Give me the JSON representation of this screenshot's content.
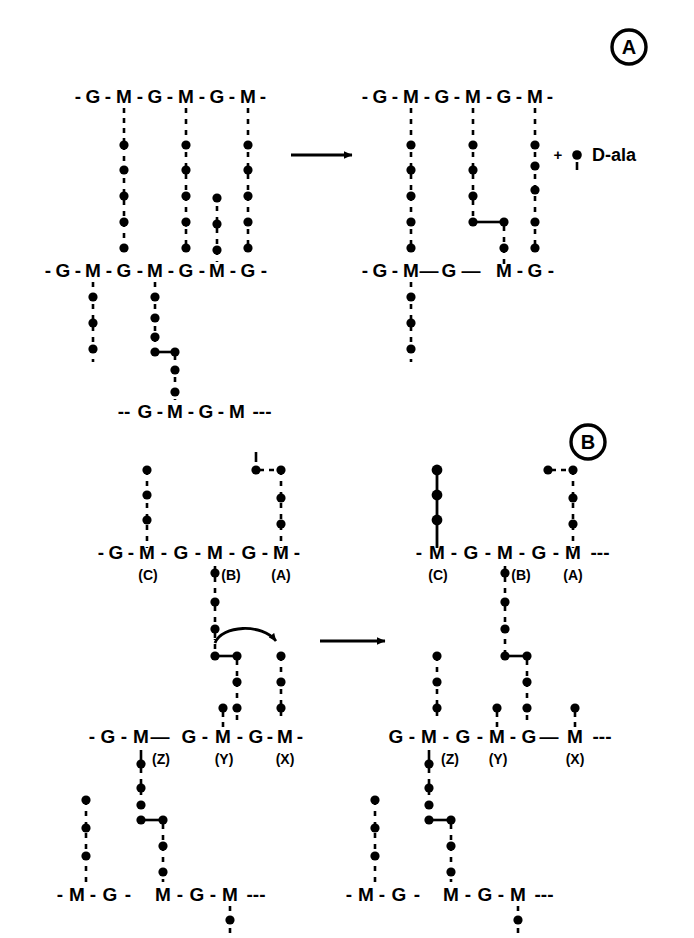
{
  "figure": {
    "ink_color": "#000000",
    "background_color": "#ffffff",
    "panels": [
      {
        "id": "A",
        "label": "A",
        "badge_shape": "circle"
      },
      {
        "id": "B",
        "label": "B",
        "badge_shape": "circle"
      }
    ]
  },
  "glyphs": {
    "glcnac": "G",
    "murnac": "M",
    "dash": "-",
    "long_dash": "—",
    "plus": "+",
    "ellipsis_dashes": "---",
    "lead_dashes": "--"
  },
  "panel_a": {
    "badge": "A",
    "arrow": {
      "name": "reaction-arrow",
      "direction": "right"
    },
    "side_note": {
      "plus": "+",
      "text": "D-ala"
    },
    "left": {
      "chain_top": {
        "name": "glycan-chain-top-left",
        "prefix": "-",
        "residues": [
          "G",
          "M",
          "G",
          "M",
          "G",
          "M"
        ],
        "suffix": "-"
      },
      "chain_middle": {
        "name": "glycan-chain-middle-left",
        "prefix": "-",
        "residues": [
          "G",
          "M",
          "G",
          "M",
          "G",
          "M",
          "G"
        ],
        "suffix": "-"
      },
      "chain_bottom": {
        "name": "glycan-chain-bottom-left",
        "prefix": "--",
        "residues": [
          "G",
          "M",
          "G",
          "M"
        ],
        "suffix": "---"
      },
      "plus_marker": "+"
    },
    "right": {
      "chain_top": {
        "name": "glycan-chain-top-right",
        "prefix": "-",
        "residues": [
          "G",
          "M",
          "G",
          "M",
          "G",
          "M"
        ],
        "suffix": "-"
      },
      "chain_middle": {
        "name": "glycan-chain-middle-right",
        "prefix": "-",
        "residues": [
          "G",
          "M",
          "G",
          "M",
          "G"
        ],
        "suffix": "-"
      }
    }
  },
  "panel_b": {
    "badge": "B",
    "arrow": {
      "name": "reaction-arrow",
      "direction": "right"
    },
    "curved_arrow": {
      "name": "transfer-arrow",
      "direction": "right-curved"
    },
    "left": {
      "chain_top": {
        "name": "glycan-chain-top-left",
        "prefix": "-",
        "residues": [
          "G",
          "M",
          "G",
          "M",
          "G",
          "M"
        ],
        "suffix": "-",
        "site_labels": [
          "(C)",
          "(B)",
          "(A)"
        ]
      },
      "chain_middle": {
        "name": "glycan-chain-middle-left",
        "prefix": "-",
        "residues": [
          "G",
          "M",
          "G",
          "M",
          "G",
          "M"
        ],
        "suffix": "-",
        "site_labels": [
          "(Z)",
          "(Y)",
          "(X)"
        ]
      },
      "chain_bottom": {
        "name": "glycan-chain-bottom-left",
        "prefix": "-",
        "residues": [
          "M",
          "G",
          "M",
          "G",
          "M"
        ],
        "suffix": "---"
      }
    },
    "right": {
      "chain_top": {
        "name": "glycan-chain-top-right",
        "prefix": "-",
        "residues": [
          "M",
          "G",
          "M",
          "G",
          "M"
        ],
        "suffix": "---",
        "site_labels": [
          "(C)",
          "(B)",
          "(A)"
        ]
      },
      "chain_middle": {
        "name": "glycan-chain-middle-right",
        "prefix": "",
        "residues": [
          "G",
          "M",
          "G",
          "M",
          "G",
          "M"
        ],
        "suffix": "---",
        "site_labels": [
          "(Z)",
          "(Y)",
          "(X)"
        ]
      },
      "chain_bottom": {
        "name": "glycan-chain-bottom-right",
        "prefix": "-",
        "residues": [
          "M",
          "G",
          "M",
          "G",
          "M"
        ],
        "suffix": "---"
      }
    }
  },
  "legend_semantics": {
    "dot": "amino-acid-residue",
    "dotted_vertical": "stem-peptide",
    "dotted_horizontal": "cross-bridge",
    "solid_vertical": "nascent-peptide-bond"
  }
}
